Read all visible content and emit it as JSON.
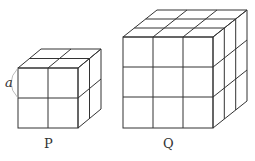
{
  "figure": {
    "cube_p": {
      "label": "P",
      "divisions": 2,
      "edge_label": "a"
    },
    "cube_q": {
      "label": "Q",
      "divisions": 3
    }
  }
}
